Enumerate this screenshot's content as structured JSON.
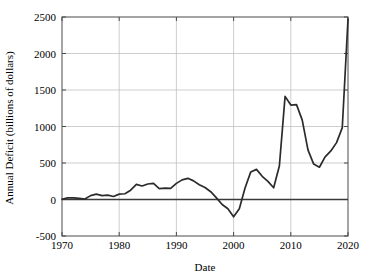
{
  "chart_data": {
    "type": "line",
    "title": "",
    "xlabel": "Date",
    "ylabel": "Annual Deficit (billions of dollars)",
    "xlim": [
      1970,
      2020
    ],
    "ylim": [
      -500,
      2500
    ],
    "xticks": [
      1970,
      1980,
      1990,
      2000,
      2010,
      2020
    ],
    "xtick_labels": [
      "1970",
      "1980",
      "1990",
      "2000",
      "2010",
      "2020"
    ],
    "yticks": [
      -500,
      0,
      500,
      1000,
      1500,
      2000,
      2500
    ],
    "ytick_labels": [
      "-500",
      "0",
      "500",
      "1000",
      "1500",
      "2000",
      "2500"
    ],
    "grid": true,
    "legend": "none",
    "zero_reference_line": 0,
    "line_color": "#2b2b2b",
    "grid_color": "#b9b9b9",
    "frame_color": "#4a4a4a",
    "background_color": "#ffffff",
    "series": [
      {
        "name": "Annual Deficit",
        "x": [
          1970,
          1971,
          1972,
          1973,
          1974,
          1975,
          1976,
          1977,
          1978,
          1979,
          1980,
          1981,
          1982,
          1983,
          1984,
          1985,
          1986,
          1987,
          1988,
          1989,
          1990,
          1991,
          1992,
          1993,
          1994,
          1995,
          1996,
          1997,
          1998,
          1999,
          2000,
          2001,
          2002,
          2003,
          2004,
          2005,
          2006,
          2007,
          2008,
          2009,
          2010,
          2011,
          2012,
          2013,
          2014,
          2015,
          2016,
          2017,
          2018,
          2019,
          2020
        ],
        "values": [
          3,
          23,
          23,
          15,
          6,
          53,
          74,
          54,
          59,
          41,
          74,
          79,
          128,
          208,
          185,
          212,
          221,
          150,
          155,
          153,
          221,
          269,
          290,
          255,
          203,
          164,
          107,
          22,
          -69,
          -126,
          -236,
          -128,
          158,
          378,
          413,
          318,
          248,
          161,
          459,
          1413,
          1294,
          1300,
          1087,
          680,
          485,
          442,
          585,
          665,
          779,
          984,
          2470
        ]
      }
    ]
  },
  "axis": {
    "x_title": "Date",
    "y_title": "Annual Deficit (billions of dollars)"
  }
}
